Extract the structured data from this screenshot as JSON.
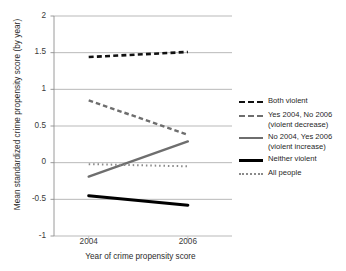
{
  "chart_data": {
    "type": "line",
    "title": "",
    "xlabel": "Year of crime propensity score",
    "ylabel": "Mean standardized crime propensity score (by year)",
    "x": [
      2004,
      2006
    ],
    "xtick_labels": [
      "2004",
      "2006"
    ],
    "ytick_labels": [
      "2",
      "1.5",
      "1",
      "0.5",
      "0",
      "-0.5",
      "-1"
    ],
    "ylim": [
      -1,
      2
    ],
    "ytick_values": [
      2,
      1.5,
      1,
      0.5,
      0,
      -0.5,
      -1
    ],
    "grid": "horizontal",
    "legend_position": "right",
    "series": [
      {
        "name": "Both violent",
        "label": "Both violent",
        "values": [
          1.44,
          1.51
        ],
        "style": "dashed",
        "color": "#111111",
        "width": 2.6
      },
      {
        "name": "Yes 2004, No 2006 (violent decrease)",
        "label": "Yes 2004, No 2006\n(violent decrease)",
        "values": [
          0.85,
          0.38
        ],
        "style": "dashed",
        "color": "#6e6e6e",
        "width": 2.4
      },
      {
        "name": "No 2004, Yes 2006 (violent increase)",
        "label": "No 2004, Yes 2006\n(violent increase)",
        "values": [
          -0.19,
          0.29
        ],
        "style": "solid",
        "color": "#6e6e6e",
        "width": 2.4
      },
      {
        "name": "Neither violent",
        "label": "Neither violent",
        "values": [
          -0.45,
          -0.58
        ],
        "style": "solid",
        "color": "#000000",
        "width": 3.0
      },
      {
        "name": "All people",
        "label": "All people",
        "values": [
          -0.02,
          -0.05
        ],
        "style": "dotted",
        "color": "#8a8a8a",
        "width": 2.0
      }
    ]
  },
  "axes": {
    "y_title": "Mean standardized crime propensity score (by year)",
    "x_title": "Year of crime propensity score"
  }
}
